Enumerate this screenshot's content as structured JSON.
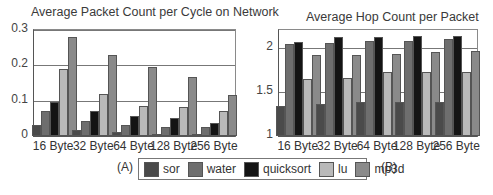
{
  "chart_data": [
    {
      "type": "bar",
      "title": "Average Packet Count per Cycle on Network",
      "panel_label": "(A)",
      "xlabel": "",
      "ylabel": "",
      "categories": [
        "16 Byte",
        "32 Byte",
        "64 Byte",
        "128 Byte",
        "256 Byte"
      ],
      "ylim": [
        0,
        0.3
      ],
      "yticks": [
        "0",
        "0.1",
        "0.2",
        "0.3"
      ],
      "grid": true,
      "series": [
        {
          "name": "sor",
          "values": [
            0.03,
            0.018,
            0.01,
            0.006,
            0.005
          ]
        },
        {
          "name": "water",
          "values": [
            0.07,
            0.043,
            0.032,
            0.026,
            0.026
          ]
        },
        {
          "name": "quicksort",
          "values": [
            0.095,
            0.07,
            0.057,
            0.052,
            0.038
          ]
        },
        {
          "name": "lu",
          "values": [
            0.19,
            0.12,
            0.085,
            0.083,
            0.072
          ]
        },
        {
          "name": "mp3d",
          "values": [
            0.28,
            0.23,
            0.195,
            0.168,
            0.117
          ]
        }
      ]
    },
    {
      "type": "bar",
      "title": "Average Hop Count per Packet",
      "panel_label": "(B)",
      "xlabel": "",
      "ylabel": "",
      "categories": [
        "16 Byte",
        "32 Byte",
        "64 Byte",
        "128 Byte",
        "256 Byte"
      ],
      "ylim": [
        1,
        2.2
      ],
      "yticks": [
        "1",
        "1.5",
        "2"
      ],
      "grid": true,
      "series": [
        {
          "name": "sor",
          "values": [
            1.34,
            1.36,
            1.38,
            1.38,
            1.39
          ]
        },
        {
          "name": "water",
          "values": [
            2.04,
            2.05,
            2.07,
            2.07,
            2.1
          ]
        },
        {
          "name": "quicksort",
          "values": [
            2.06,
            2.12,
            2.12,
            2.13,
            2.13
          ]
        },
        {
          "name": "lu",
          "values": [
            1.65,
            1.66,
            1.72,
            1.73,
            1.73
          ]
        },
        {
          "name": "mp3d",
          "values": [
            1.92,
            1.92,
            1.93,
            1.95,
            1.96
          ]
        }
      ]
    }
  ],
  "legend": {
    "position": "bottom-center",
    "items": [
      {
        "label": "sor",
        "color": "#4a4a4a"
      },
      {
        "label": "water",
        "color": "#6e6e6e"
      },
      {
        "label": "quicksort",
        "color": "#141414"
      },
      {
        "label": "lu",
        "color": "#b9b9b9"
      },
      {
        "label": "mp3d",
        "color": "#8a8a8a"
      }
    ]
  }
}
